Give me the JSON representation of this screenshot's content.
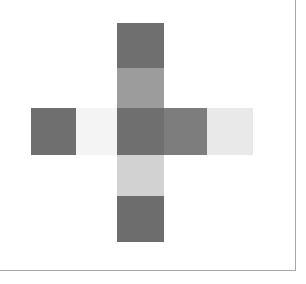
{
  "figure": {
    "background_color": "#ffffff",
    "frame": {
      "line_color": "#a9a9ad",
      "right_rule_label": "right-frame-rule",
      "bottom_rule_label": "bottom-frame-rule"
    },
    "palette": {
      "dark_gray": "#706f70",
      "mid_gray": "#9c9c9c",
      "light_gray": "#d2d2d2",
      "pale_gray": "#e9e9e9",
      "near_white": "#f4f4f4"
    },
    "cells": [
      {
        "name": "cell-top",
        "label": "top square",
        "x": 117,
        "y": 23,
        "w": 47,
        "h": 45,
        "color": "#706f70"
      },
      {
        "name": "cell-upper-middle",
        "label": "upper middle square",
        "x": 117,
        "y": 68,
        "w": 47,
        "h": 40,
        "color": "#9c9c9c"
      },
      {
        "name": "cell-left-outer",
        "label": "far left square",
        "x": 31,
        "y": 108,
        "w": 45,
        "h": 47,
        "color": "#706f70"
      },
      {
        "name": "cell-left-inner",
        "label": "left inner square",
        "x": 76,
        "y": 108,
        "w": 41,
        "h": 47,
        "color": "#f4f4f4"
      },
      {
        "name": "cell-center",
        "label": "center square",
        "x": 117,
        "y": 108,
        "w": 47,
        "h": 47,
        "color": "#706f70"
      },
      {
        "name": "cell-right-inner",
        "label": "right inner square",
        "x": 164,
        "y": 108,
        "w": 43,
        "h": 47,
        "color": "#7d7d7d"
      },
      {
        "name": "cell-right-outer",
        "label": "far right square",
        "x": 207,
        "y": 108,
        "w": 46,
        "h": 47,
        "color": "#e9e9e9"
      },
      {
        "name": "cell-lower-middle",
        "label": "lower middle square",
        "x": 117,
        "y": 155,
        "w": 47,
        "h": 41,
        "color": "#d2d2d2"
      },
      {
        "name": "cell-bottom",
        "label": "bottom square",
        "x": 117,
        "y": 196,
        "w": 47,
        "h": 46,
        "color": "#6e6d6e"
      }
    ]
  }
}
